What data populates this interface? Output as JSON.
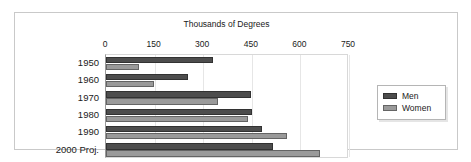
{
  "chart_data": {
    "type": "bar",
    "orientation": "horizontal",
    "title": "",
    "xlabel": "Thousands of Degrees",
    "ylabel": "",
    "categories": [
      "1950",
      "1960",
      "1970",
      "1980",
      "1990",
      "2000 Proj."
    ],
    "series": [
      {
        "name": "Men",
        "color": "#4d4d4d",
        "values": [
          331,
          254,
          447,
          450,
          481,
          515
        ]
      },
      {
        "name": "Women",
        "color": "#9a9a9a",
        "values": [
          103,
          149,
          347,
          438,
          559,
          660
        ]
      }
    ],
    "xlim": [
      0,
      750
    ],
    "xticks": [
      0,
      150,
      300,
      450,
      600,
      750
    ],
    "xtick_labels": [
      "0",
      "150",
      "300",
      "450",
      "600",
      "750"
    ],
    "grid": true,
    "legend_position": "right"
  },
  "legend": {
    "entries": [
      {
        "label": "Men",
        "color": "#4d4d4d"
      },
      {
        "label": "Women",
        "color": "#9a9a9a"
      }
    ]
  },
  "colors": {
    "men": "#4d4d4d",
    "women": "#9a9a9a",
    "frame_border": "#c9c9c9",
    "gridline": "#e6e6e6",
    "text": "#1a1a1a",
    "background": "#ffffff"
  }
}
